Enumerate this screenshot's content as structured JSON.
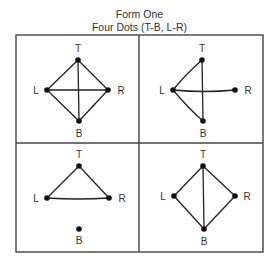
{
  "header": {
    "title": "Form One",
    "subtitle": "Four Dots (T-B, L-R)"
  },
  "colors": {
    "ink": "#222222",
    "border": "#444444",
    "background": "#ffffff"
  },
  "node_labels": {
    "top": "T",
    "left": "L",
    "right": "R",
    "bottom": "B"
  },
  "panels": [
    {
      "position": "top-left",
      "edges": [
        "T-L",
        "T-R",
        "T-B",
        "L-R",
        "L-B",
        "R-B"
      ]
    },
    {
      "position": "top-right",
      "edges": [
        "T-L",
        "T-B",
        "L-R",
        "L-B"
      ]
    },
    {
      "position": "bottom-left",
      "edges": [
        "T-L",
        "T-R",
        "L-R"
      ]
    },
    {
      "position": "bottom-right",
      "edges": [
        "T-L",
        "T-R",
        "T-B",
        "L-B",
        "R-B"
      ]
    }
  ]
}
